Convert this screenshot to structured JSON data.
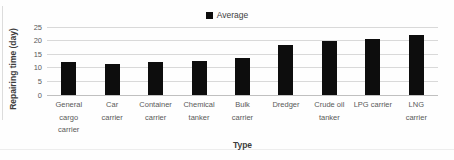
{
  "chart_data": {
    "type": "bar",
    "title": "",
    "xlabel": "Type",
    "ylabel": "Repairing time (day)",
    "ylim": [
      0,
      25
    ],
    "yticks": [
      0,
      5,
      10,
      15,
      20,
      25
    ],
    "grid": true,
    "legend_position": "top-center",
    "categories": [
      "General cargo carrier",
      "Car carrier",
      "Container carrier",
      "Chemical tanker",
      "Bulk carrier",
      "Dredger",
      "Crude oil tanker",
      "LPG carrier",
      "LNG carrier"
    ],
    "category_label_lines": [
      [
        "General",
        "cargo",
        "carrier"
      ],
      [
        "Car",
        "carrier"
      ],
      [
        "Container",
        "carrier"
      ],
      [
        "Chemical",
        "tanker"
      ],
      [
        "Bulk",
        "carrier"
      ],
      [
        "Dredger"
      ],
      [
        "Crude oil",
        "tanker"
      ],
      [
        "LPG carrier"
      ],
      [
        "LNG",
        "carrier"
      ]
    ],
    "series": [
      {
        "name": "Average",
        "values": [
          12,
          11.5,
          12,
          12.5,
          13.5,
          18.5,
          20,
          20.5,
          22
        ]
      }
    ]
  },
  "colors": {
    "bar": "#0d0d0d",
    "grid": "#d9d9d9",
    "axis_zero_line": "#c0c0c0",
    "tick_text": "#595959",
    "title_text": "#3d3d3d"
  }
}
